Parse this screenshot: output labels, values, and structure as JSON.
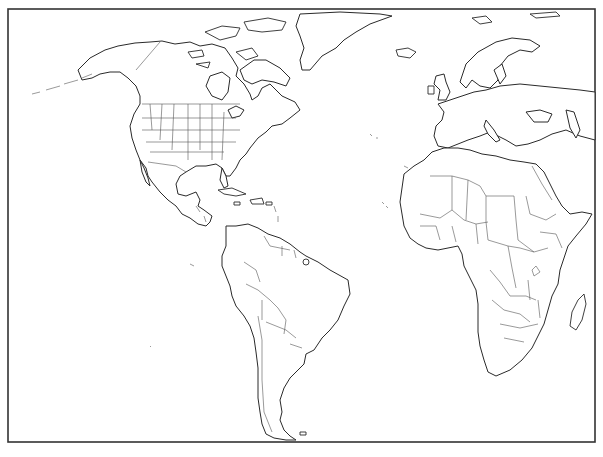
{
  "map": {
    "type": "blank outline political map",
    "projection": "Miller cylindrical (approx.)",
    "regions_shown": [
      "North America",
      "Central America",
      "Caribbean",
      "South America",
      "Greenland",
      "Europe",
      "Africa",
      "Atlantic Ocean"
    ],
    "colors": {
      "background": "#ffffff",
      "coastline": "#2a2a2a",
      "borders": "#555555",
      "frame": "#333333"
    },
    "labels": []
  }
}
